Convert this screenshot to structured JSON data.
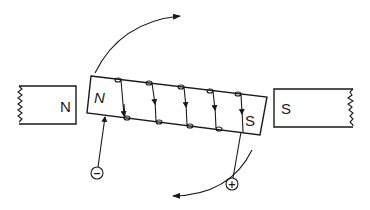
{
  "diagram": {
    "left_pole": {
      "label": "N"
    },
    "right_pole": {
      "label": "S"
    },
    "armature": {
      "left_label": "N",
      "right_label": "S"
    },
    "terminals": {
      "negative": "−",
      "positive": "+"
    },
    "rotation_arrows": [
      "clockwise-top",
      "clockwise-bottom"
    ],
    "coil_turns": 5,
    "colors": {
      "ink": "#1a1a1a",
      "background": "#ffffff"
    }
  }
}
